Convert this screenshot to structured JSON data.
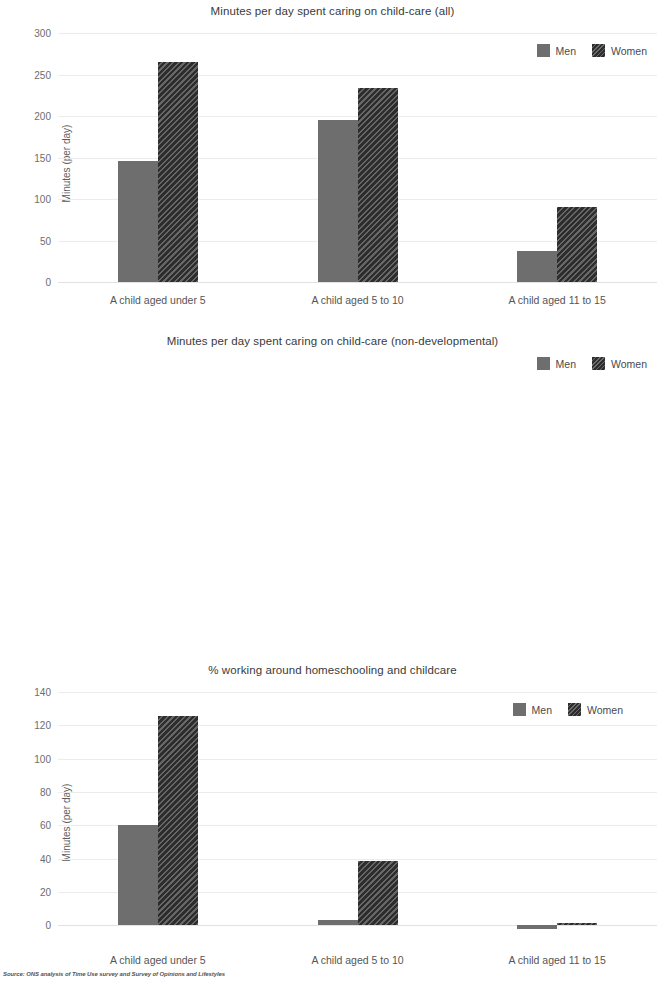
{
  "source_note": "Source: ONS analysis of Time Use survey and Survey of Opinions and Lifestyles",
  "legend": {
    "men_label": "Men",
    "women_label": "Women",
    "men_color": "#6e6e6e",
    "women_color": "#2d2d2d"
  },
  "chart_data": [
    {
      "type": "bar",
      "title": "Minutes per day spent caring on child-care (all)",
      "xlabel": "",
      "ylabel": "Minutes (per day)",
      "ylim": [
        0,
        300
      ],
      "yticks": [
        "0",
        "50",
        "100",
        "150",
        "200",
        "250",
        "300"
      ],
      "ytick_values": [
        0,
        50,
        100,
        150,
        200,
        250,
        300
      ],
      "grid": true,
      "legend_position": "top-right",
      "categories": [
        "A child aged under 5",
        "A child aged 5 to 10",
        "A child aged 11 to 15"
      ],
      "series": [
        {
          "name": "Men",
          "values": [
            146,
            195,
            37
          ]
        },
        {
          "name": "Women",
          "values": [
            265,
            234,
            90
          ]
        }
      ]
    },
    {
      "type": "bar",
      "title": "Minutes per day spent caring on child-care (non-developmental)",
      "xlabel": "",
      "ylabel": "Minutes (per day)",
      "ylim": [
        -10,
        140
      ],
      "yticks": [
        "0",
        "20",
        "40",
        "60",
        "80",
        "100",
        "120",
        "140"
      ],
      "ytick_values": [
        0,
        20,
        40,
        60,
        80,
        100,
        120,
        140
      ],
      "grid": true,
      "legend_position": "top-right",
      "categories": [
        "A child aged under 5",
        "A child aged 5 to 10",
        "A child aged 11 to 15"
      ],
      "series": [
        {
          "name": "Men",
          "values": [
            60,
            3.5,
            -2.5
          ]
        },
        {
          "name": "Women",
          "values": [
            125.5,
            38.5,
            1.5
          ]
        }
      ]
    },
    {
      "type": "bar",
      "title": "% working around homeschooling and childcare",
      "xlabel": "",
      "ylabel": "%",
      "ylim": [
        0,
        70
      ],
      "yticks": [
        "0.0",
        "10.0",
        "20.0",
        "30.0",
        "40.0",
        "50.0",
        "60.0",
        "70.0"
      ],
      "ytick_values": [
        0,
        10,
        20,
        30,
        40,
        50,
        60,
        70
      ],
      "grid": true,
      "legend_position": "top-right",
      "categories": [
        "Work around homeschool",
        "Work around childcare"
      ],
      "series": [
        {
          "name": "Men",
          "values": [
            43.3,
            45.3
          ]
        },
        {
          "name": "Women",
          "values": [
            58.0,
            56.7
          ]
        }
      ]
    }
  ]
}
